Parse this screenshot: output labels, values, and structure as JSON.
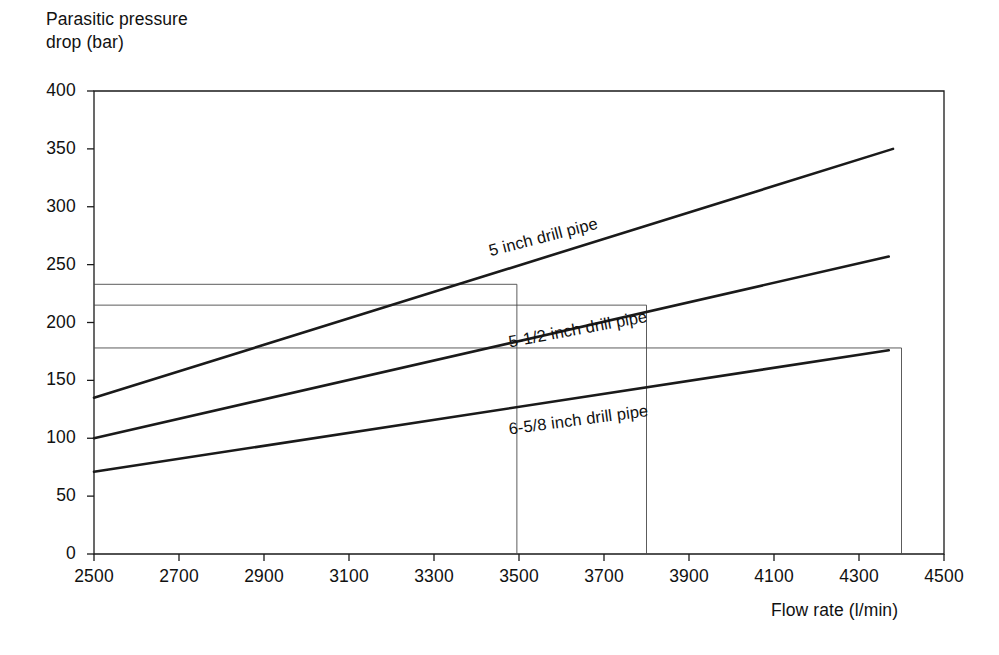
{
  "chart_data": {
    "type": "line",
    "title": "",
    "xlabel": "Flow rate (l/min)",
    "ylabel": "Parasitic pressure\ndrop (bar)",
    "ylabel_line1": "Parasitic pressure",
    "ylabel_line2": "drop (bar)",
    "xlim": [
      2500,
      4500
    ],
    "ylim": [
      0,
      400
    ],
    "xticks": [
      2500,
      2700,
      2900,
      3100,
      3300,
      3500,
      3700,
      3900,
      4100,
      4300,
      4500
    ],
    "yticks": [
      0,
      50,
      100,
      150,
      200,
      250,
      300,
      350,
      400
    ],
    "grid": false,
    "legend": "inline-labels",
    "line_color": "#1a1a1a",
    "guide_color": "#4a4a4a",
    "series": [
      {
        "name": "5 inch drill pipe",
        "x": [
          2500,
          4380
        ],
        "values": [
          135,
          350
        ],
        "label_x": 3560,
        "label_y": 262,
        "label_rotation": -14.5
      },
      {
        "name": "5-1/2 inch drill pipe",
        "x": [
          2500,
          4370
        ],
        "values": [
          100,
          257
        ],
        "label_x": 3640,
        "label_y": 183,
        "label_rotation": -10.5
      },
      {
        "name": "6-5/8 inch drill pipe",
        "x": [
          2500,
          4370
        ],
        "values": [
          71,
          176
        ],
        "label_x": 3640,
        "label_y": 108,
        "label_rotation": -7.5
      }
    ],
    "guides": {
      "horizontal": [
        {
          "y": 233,
          "x_from": 2500,
          "x_to": 3495
        },
        {
          "y": 215,
          "x_from": 2500,
          "x_to": 3800
        },
        {
          "y": 178,
          "x_from": 2500,
          "x_to": 4400
        }
      ],
      "vertical": [
        {
          "x": 3495,
          "y_from": 233,
          "y_to": 0
        },
        {
          "x": 3800,
          "y_from": 215,
          "y_to": 0
        },
        {
          "x": 4400,
          "y_from": 178,
          "y_to": 0
        }
      ]
    },
    "annotations": []
  },
  "axes": {
    "y_title_line1": "Parasitic pressure",
    "y_title_line2": "drop (bar)",
    "x_title": "Flow rate (l/min)"
  }
}
